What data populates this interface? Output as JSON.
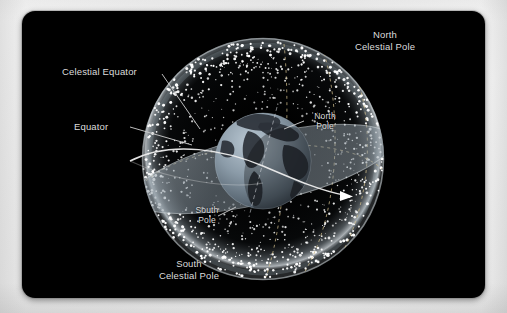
{
  "figure": {
    "type": "astronomy-diagram",
    "background_color": "#000000",
    "frame_color": "#efefef",
    "label_color": "#dcdcdc"
  },
  "labels": {
    "north_celestial_pole": "North\nCelestial Pole",
    "south_celestial_pole": "South\nCelestial Pole",
    "celestial_equator": "Celestial Equator",
    "equator": "Equator",
    "north_pole": "North\nPole",
    "south_pole": "South\nPole"
  },
  "elements": {
    "celestial_sphere": "celestial-sphere",
    "star_field": "star-field",
    "earth_globe": "earth-globe",
    "celestial_equator_plane": "celestial-equator-plane",
    "equator_line": "equator-line",
    "equator_arrow": "equator-direction-arrow",
    "polar_axis": "polar-axis",
    "meridian_lines": "dashed-meridian-lines"
  },
  "colors": {
    "sphere_rim": "#c9cfd4",
    "plane_fill": "#8e9aa3",
    "earth_ocean": "#8fa0ad",
    "earth_land": "#2b3138",
    "meridian": "#cdbb8a",
    "equator_line": "#e8e8e8"
  }
}
